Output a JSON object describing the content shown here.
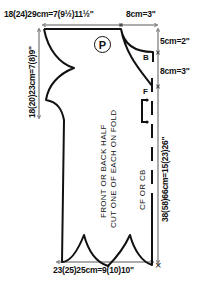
{
  "pattern": {
    "piece_symbol": "P",
    "notches": [
      "B",
      "F"
    ],
    "piece_instructions": {
      "line1": "FRONT OR BACK HALF",
      "line2": "CUT ONE OF EACH ON FOLD"
    },
    "fold_label": "CF OR CB",
    "corner_mark": "×"
  },
  "dimensions": {
    "top_width": "18(24)29cm=7(9½)11½\"",
    "top_right_width": "8cm=3\"",
    "left_height": "18(20)23cm=7(8)9\"",
    "right_upper": "5cm=2\"",
    "right_middle": "8cm=3\"",
    "right_length": "38(58)66cm=15(23)26\"",
    "bottom_width": "23(25)25cm=9(10)10\""
  },
  "colors": {
    "ink": "#111111",
    "background": "#ffffff"
  }
}
